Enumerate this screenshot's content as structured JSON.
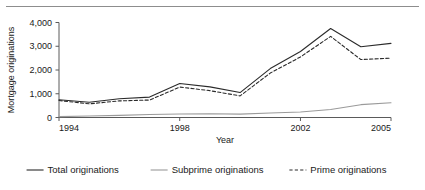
{
  "chart_data": {
    "type": "line",
    "title": "",
    "xlabel": "Year",
    "ylabel": "Mortgage originations",
    "x": [
      1994,
      1995,
      1996,
      1997,
      1998,
      1999,
      2000,
      2001,
      2002,
      2003,
      2004,
      2005
    ],
    "xlim": [
      1994,
      2005
    ],
    "ylim": [
      0,
      4000
    ],
    "xticks": [
      1994,
      1998,
      2002,
      2005
    ],
    "xticklabels": [
      "1994",
      "1998",
      "2002",
      "2005"
    ],
    "yticks": [
      0,
      1000,
      2000,
      3000,
      4000
    ],
    "yticklabels": [
      "0",
      "1,000",
      "2,000",
      "3,000",
      "4,000"
    ],
    "grid": false,
    "legend_position": "bottom",
    "series": [
      {
        "name": "Total originations",
        "style": "solid",
        "color": "#2b2b2b",
        "values": [
          750,
          640,
          790,
          860,
          1430,
          1290,
          1050,
          2060,
          2780,
          3750,
          2980,
          3120
        ]
      },
      {
        "name": "Subprime originations",
        "style": "solid",
        "color": "#9a9a9a",
        "values": [
          35,
          65,
          90,
          125,
          150,
          160,
          140,
          190,
          230,
          335,
          540,
          620
        ]
      },
      {
        "name": "Prime originations",
        "style": "dashed",
        "color": "#2b2b2b",
        "values": [
          715,
          575,
          700,
          735,
          1280,
          1130,
          910,
          1870,
          2550,
          3415,
          2440,
          2500
        ]
      }
    ]
  },
  "axes": {
    "y_title": "Mortgage originations",
    "x_title": "Year"
  },
  "legend": {
    "items": [
      {
        "label": "Total originations",
        "style": "solid",
        "color": "#2b2b2b"
      },
      {
        "label": "Subprime originations",
        "style": "solid",
        "color": "#9a9a9a"
      },
      {
        "label": "Prime originations",
        "style": "dashed",
        "color": "#2b2b2b"
      }
    ]
  },
  "colors": {
    "total": "#2b2b2b",
    "subprime": "#9a9a9a",
    "prime": "#2b2b2b",
    "axis": "#5a5a5a",
    "rule": "#8d8d8d",
    "background": "#ffffff"
  }
}
